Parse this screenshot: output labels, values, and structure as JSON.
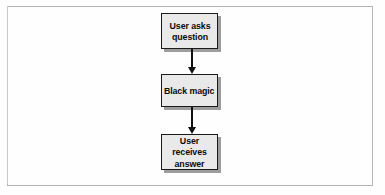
{
  "figure": {
    "type": "flowchart",
    "orientation": "vertical",
    "frame": {
      "border_color": "#b4b4b4",
      "background_color": "#fefefe"
    },
    "node_style": {
      "fill_color": "#e9e9e9",
      "border_color": "#1b1b1b",
      "shadow_color": "#8c8c8c",
      "text_color": "#0b0b0b"
    },
    "connector_style": {
      "color": "#111111",
      "arrowhead": "solid-triangle",
      "direction": "down"
    },
    "nodes": [
      {
        "id": "question",
        "label": "User asks\nquestion"
      },
      {
        "id": "black_magic",
        "label": "Black magic"
      },
      {
        "id": "answer",
        "label": "User receives\nanswer"
      }
    ],
    "edges": [
      {
        "id": "question_to_magic",
        "from": "question",
        "to": "black_magic",
        "label": ""
      },
      {
        "id": "magic_to_answer",
        "from": "black_magic",
        "to": "answer",
        "label": ""
      }
    ]
  }
}
